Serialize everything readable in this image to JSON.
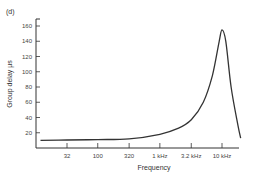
{
  "figure": {
    "panel_label": "(d)"
  },
  "chart_data": {
    "type": "line",
    "title": "",
    "panel_label": "(d)",
    "xlabel": "Frequency",
    "ylabel": "Group delay µs",
    "x_scale": "log",
    "x_ticks": [
      "32",
      "100",
      "320",
      "1 kHz",
      "3.2 kHz",
      "10 kHz"
    ],
    "x_tick_values_hz": [
      32,
      100,
      320,
      1000,
      3200,
      10000
    ],
    "y_ticks": [
      20,
      40,
      60,
      80,
      100,
      120,
      140,
      160
    ],
    "ylim": [
      0,
      170
    ],
    "grid": false,
    "legend": null,
    "series": [
      {
        "name": "Group delay",
        "x_hz": [
          12,
          32,
          100,
          320,
          1000,
          2000,
          3200,
          5000,
          7000,
          9000,
          10000,
          11500,
          14000,
          18000,
          20000
        ],
        "y_us": [
          10,
          10.5,
          11,
          12,
          18,
          26,
          37,
          60,
          95,
          140,
          155,
          140,
          80,
          30,
          13
        ]
      }
    ]
  }
}
